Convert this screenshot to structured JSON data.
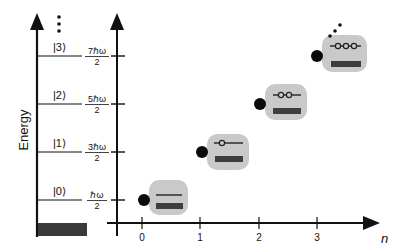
{
  "diagram": {
    "left_axis": {
      "label": "Energy",
      "continuation_marker": "⋮",
      "levels": [
        {
          "ket": "|0⟩",
          "energy_num": "ℏω",
          "energy_den": "2",
          "y": 200
        },
        {
          "ket": "|1⟩",
          "energy_num": "3ℏω",
          "energy_den": "2",
          "y": 152
        },
        {
          "ket": "|2⟩",
          "energy_num": "5ℏω",
          "energy_den": "2",
          "y": 104
        },
        {
          "ket": "|3⟩",
          "energy_num": "7ℏω",
          "energy_den": "2",
          "y": 56
        }
      ],
      "ground_block_color": "#3a3a3a"
    },
    "right_axis": {
      "x_label": "n",
      "x_ticks": [
        "0",
        "1",
        "2",
        "3"
      ],
      "states": [
        {
          "n": 0,
          "excitations": 0
        },
        {
          "n": 1,
          "excitations": 1
        },
        {
          "n": 2,
          "excitations": 2
        },
        {
          "n": 3,
          "excitations": 3
        }
      ]
    },
    "colors": {
      "axis": "#111111",
      "box_fill": "#c9c9c9",
      "bar_fill": "#3d3d3d",
      "dot_fill": "#0a0a0a"
    }
  }
}
